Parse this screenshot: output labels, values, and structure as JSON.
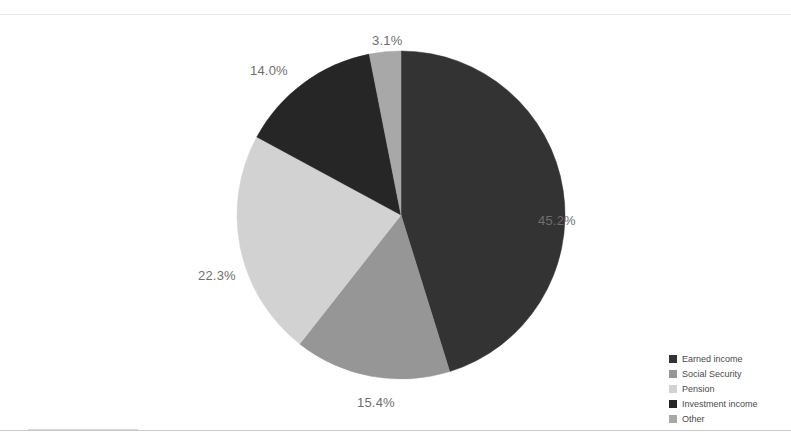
{
  "chart_data": {
    "type": "pie",
    "title": "",
    "categories": [
      "Earned income",
      "Social Security",
      "Pension",
      "Investment income",
      "Other"
    ],
    "values": [
      45.2,
      15.4,
      22.3,
      14.0,
      3.1
    ],
    "value_labels": [
      "45.2%",
      "15.4%",
      "22.3%",
      "14.0%",
      "3.1%"
    ],
    "colors": [
      "#333333",
      "#969696",
      "#d2d2d2",
      "#262626",
      "#a8a8a8"
    ],
    "start_angle_deg": 0,
    "direction": "clockwise",
    "legend_position": "bottom-right",
    "grid": false,
    "units": "percent"
  },
  "labels": {
    "earned_income": "45.2%",
    "social_security": "15.4%",
    "pension": "22.3%",
    "investment_income": "14.0%",
    "other": "3.1%"
  },
  "legend": {
    "items": [
      {
        "label": "Earned income",
        "color": "#333333"
      },
      {
        "label": "Social Security",
        "color": "#969696"
      },
      {
        "label": "Pension",
        "color": "#d2d2d2"
      },
      {
        "label": "Investment income",
        "color": "#262626"
      },
      {
        "label": "Other",
        "color": "#a8a8a8"
      }
    ]
  },
  "theme": {
    "background": "#ffffff",
    "label_color": "#6e6e6e",
    "legend_text_color": "#4a4a4a",
    "rule_color": "#c9c9c9"
  }
}
